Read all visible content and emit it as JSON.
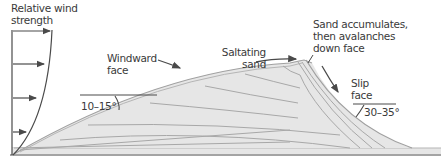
{
  "diagram": {
    "labels": {
      "wind_strength": [
        "Relative wind",
        "strength"
      ],
      "windward_face": [
        "Windward",
        "face"
      ],
      "saltating_sand": [
        "Saltating",
        "sand"
      ],
      "accumulates": [
        "Sand accumulates,",
        "then avalanches",
        "down face"
      ],
      "slip_face": [
        "Slip",
        "face"
      ],
      "windward_angle": "10–15°",
      "slip_angle": "30–35°"
    },
    "colors": {
      "dune_fill": "#e6e6e6",
      "layer_line": "#a8a8a8",
      "outline": "#4a4a4a",
      "text": "#3a3a3a"
    }
  }
}
